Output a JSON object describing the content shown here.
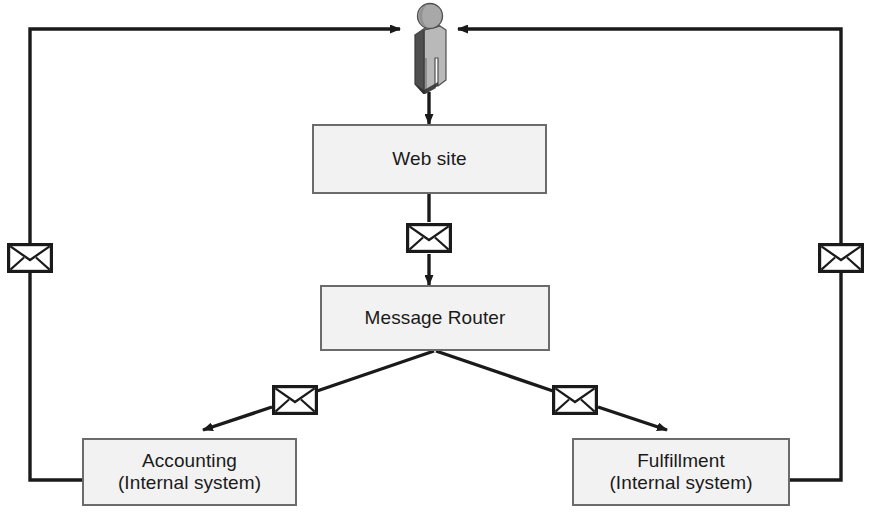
{
  "diagram": {
    "type": "flow-diagram",
    "colors": {
      "box_fill": "#f2f2f2",
      "box_border": "#6b6b6b",
      "line": "#1a1a1a",
      "actor_light": "#b4b4b4",
      "actor_mid": "#8c8c8c",
      "actor_dark": "#4a4a4a",
      "envelope_fill": "#ffffff",
      "envelope_border": "#1a1a1a",
      "background": "#ffffff"
    },
    "actor": {
      "name": "customer-actor",
      "label": ""
    },
    "nodes": [
      {
        "id": "website",
        "label": "Web site",
        "sublabel": ""
      },
      {
        "id": "message-router",
        "label": "Message Router",
        "sublabel": ""
      },
      {
        "id": "accounting",
        "label": "Accounting",
        "sublabel": "(Internal system)"
      },
      {
        "id": "fulfillment",
        "label": "Fulfillment",
        "sublabel": "(Internal system)"
      }
    ],
    "messages": [
      {
        "id": "msg-website-to-router",
        "icon": "envelope-icon"
      },
      {
        "id": "msg-router-to-accounting",
        "icon": "envelope-icon"
      },
      {
        "id": "msg-router-to-fulfillment",
        "icon": "envelope-icon"
      },
      {
        "id": "msg-accounting-to-actor",
        "icon": "envelope-icon"
      },
      {
        "id": "msg-fulfillment-to-actor",
        "icon": "envelope-icon"
      }
    ],
    "connections": [
      {
        "id": "actor-to-website",
        "from": "customer-actor",
        "to": "website",
        "arrow": true
      },
      {
        "id": "website-to-router",
        "from": "website",
        "to": "message-router",
        "arrow": true
      },
      {
        "id": "router-to-accounting",
        "from": "message-router",
        "to": "accounting",
        "arrow": true
      },
      {
        "id": "router-to-fulfillment",
        "from": "message-router",
        "to": "fulfillment",
        "arrow": true
      },
      {
        "id": "accounting-to-actor",
        "from": "accounting",
        "to": "customer-actor",
        "arrow": true
      },
      {
        "id": "fulfillment-to-actor",
        "from": "fulfillment",
        "to": "customer-actor",
        "arrow": true
      }
    ]
  }
}
